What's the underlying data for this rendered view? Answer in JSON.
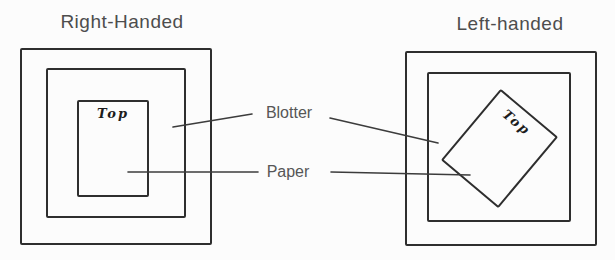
{
  "figure": {
    "background_color": "#fcfcfc",
    "ink_color": "#2e2e2e",
    "label_color": "#565656"
  },
  "diagrams": {
    "right_handed": {
      "title": "Right-Handed",
      "paper_top_label": "Top"
    },
    "left_handed": {
      "title": "Left-handed",
      "paper_top_label": "Top"
    }
  },
  "callouts": {
    "blotter": "Blotter",
    "paper": "Paper"
  }
}
